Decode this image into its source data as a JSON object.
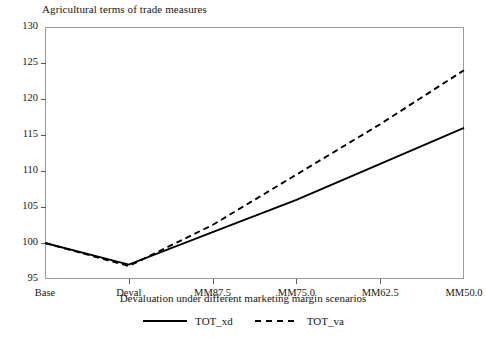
{
  "chart_data": {
    "type": "line",
    "title": "Agricultural terms of trade measures",
    "xlabel": "Devaluation under different marketing margin scenarios",
    "ylabel": "",
    "categories": [
      "Base",
      "Deval",
      "MM87.5",
      "MM75.0",
      "MM62.5",
      "MM50.0"
    ],
    "series": [
      {
        "name": "TOT_xd",
        "style": "solid",
        "color": "#000000",
        "values": [
          100.0,
          97.0,
          101.5,
          106.0,
          111.0,
          116.0
        ]
      },
      {
        "name": "TOT_va",
        "style": "dashed",
        "color": "#000000",
        "values": [
          100.0,
          96.8,
          102.5,
          109.5,
          116.5,
          124.0
        ]
      }
    ],
    "ylim": [
      95,
      130
    ],
    "yticks": [
      95,
      100,
      105,
      110,
      115,
      120,
      125,
      130
    ],
    "ytick_labels": [
      "95",
      "100",
      "105",
      "110",
      "115",
      "120",
      "125",
      "130"
    ],
    "grid": false,
    "legend_position": "bottom-center",
    "legend_entries": [
      "TOT_xd",
      "TOT_va"
    ]
  }
}
